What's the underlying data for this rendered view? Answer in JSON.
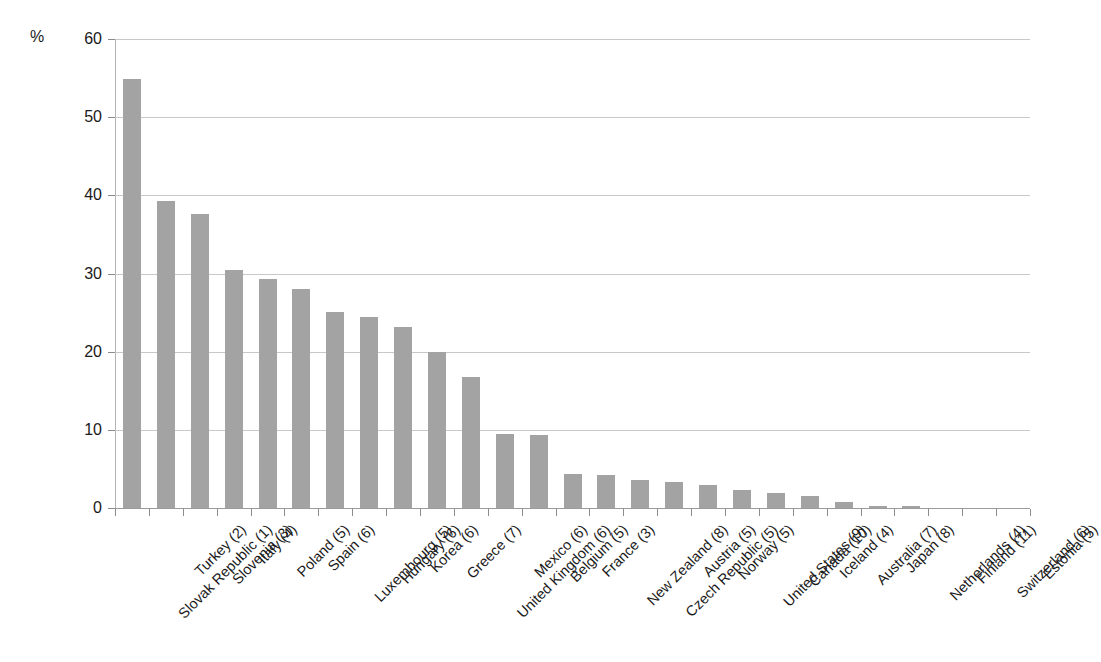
{
  "chart_data": {
    "type": "bar",
    "title": "",
    "subtitle": "",
    "xlabel": "",
    "ylabel": "%",
    "unit_label": "%",
    "ylim": [
      0,
      60
    ],
    "ytick_step": 10,
    "yticks": [
      60,
      50,
      40,
      30,
      20,
      10,
      0
    ],
    "ytick_labels": [
      "60",
      "50",
      "40",
      "30",
      "20",
      "10",
      "0"
    ],
    "grid": true,
    "grid_axis": "y",
    "legend": false,
    "legend_position": "none",
    "bar_color": "#a3a3a3",
    "gridline_color": "#c8c8c8",
    "axis_color": "#8c8c8c",
    "orientation": "vertical",
    "sorted": "descending",
    "categories": [
      "Slovak Republic (1)",
      "Turkey (2)",
      "Slovenia (3)",
      "Italy (4)",
      "Poland (5)",
      "Spain (6)",
      "Luxembourg (5)",
      "Hungary (6)",
      "Korea (6)",
      "Greece (7)",
      "United Kingdom (6)",
      "Mexico (6)",
      "Belgium (5)",
      "France (3)",
      "New Zealand (8)",
      "Czech Republic (5)",
      "Austria (5)",
      "Norway (5)",
      "United States (9)",
      "Canada (10)",
      "Iceland (4)",
      "Australia (7)",
      "Japan (8)",
      "Netherlands (4)",
      "Finland (11)",
      "Switzerland (6)",
      "Estonia (5)"
    ],
    "values": [
      54.9,
      39.3,
      37.6,
      30.4,
      29.3,
      28.0,
      25.1,
      24.5,
      23.2,
      20.0,
      16.7,
      9.5,
      9.3,
      4.3,
      4.2,
      3.6,
      3.3,
      3.0,
      2.3,
      1.9,
      1.6,
      0.8,
      0.3,
      0.3,
      0.0,
      0.0,
      0.0
    ]
  }
}
